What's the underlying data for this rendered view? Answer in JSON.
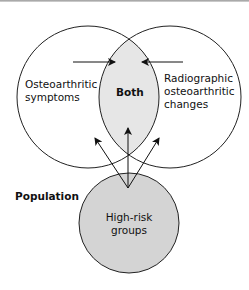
{
  "diagram": {
    "circles": {
      "left": {
        "label_line1": "Osteoarthritic",
        "label_line2": "symptoms"
      },
      "right": {
        "label_line1": "Radiographic",
        "label_line2": "osteoarthritic",
        "label_line3": "changes"
      },
      "overlap": {
        "label": "Both"
      },
      "bottom": {
        "label_line1": "High-risk",
        "label_line2": "groups"
      }
    },
    "population_label": "Population",
    "colors": {
      "overlap_fill": "#e6e6e6",
      "bottom_fill": "#d4d4d4",
      "stroke": "#222222"
    }
  }
}
